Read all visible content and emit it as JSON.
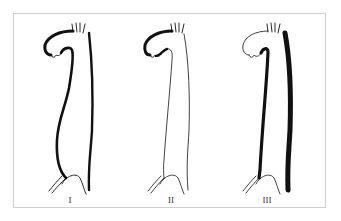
{
  "figure": {
    "panels": [
      {
        "label": "I",
        "description": "dissection involving ascending aorta, arch and descending aorta"
      },
      {
        "label": "II",
        "description": "dissection limited to ascending aorta and arch"
      },
      {
        "label": "III",
        "description": "dissection of descending aorta only"
      }
    ]
  },
  "colors": {
    "stroke": "#111111",
    "frame": "#cfcfcf",
    "background": "#ffffff"
  }
}
